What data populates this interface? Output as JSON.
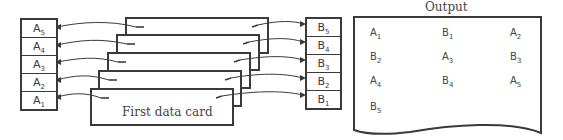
{
  "array_a": {
    "label": "A array",
    "cells": [
      {
        "name": "A",
        "sub": "5"
      },
      {
        "name": "A",
        "sub": "4"
      },
      {
        "name": "A",
        "sub": "3"
      },
      {
        "name": "A",
        "sub": "2"
      },
      {
        "name": "A",
        "sub": "1"
      }
    ]
  },
  "array_b": {
    "label": "B array",
    "cells": [
      {
        "name": "B",
        "sub": "5"
      },
      {
        "name": "B",
        "sub": "4"
      },
      {
        "name": "B",
        "sub": "3"
      },
      {
        "name": "B",
        "sub": "2"
      },
      {
        "name": "B",
        "sub": "1"
      }
    ]
  },
  "cards": {
    "count": 5,
    "first_card_label": "First data card"
  },
  "output": {
    "title": "Output",
    "rows": [
      [
        {
          "name": "A",
          "sub": "1"
        },
        {
          "name": "B",
          "sub": "1"
        },
        {
          "name": "A",
          "sub": "2"
        }
      ],
      [
        {
          "name": "B",
          "sub": "2"
        },
        {
          "name": "A",
          "sub": "3"
        },
        {
          "name": "B",
          "sub": "3"
        }
      ],
      [
        {
          "name": "A",
          "sub": "4"
        },
        {
          "name": "B",
          "sub": "4"
        },
        {
          "name": "A",
          "sub": "5"
        }
      ],
      [
        {
          "name": "B",
          "sub": "5"
        }
      ]
    ]
  }
}
